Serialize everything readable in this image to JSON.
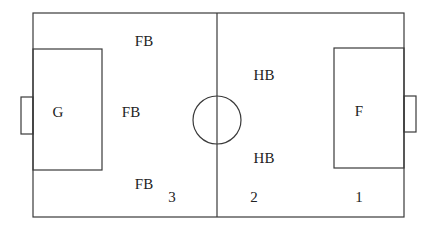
{
  "diagram": {
    "colors": {
      "line": "#3a3a3a",
      "text": "#222222",
      "background": "#ffffff"
    },
    "field": {
      "x1": 33,
      "y1": 13,
      "x2": 404,
      "y2": 217
    },
    "center_line_x": 217,
    "center_circle": {
      "cx": 217,
      "cy": 120,
      "r": 24
    },
    "left_penalty_box": {
      "x1": 33,
      "y1": 49,
      "x2": 102,
      "y2": 170
    },
    "right_penalty_box": {
      "x1": 334,
      "y1": 48,
      "x2": 404,
      "y2": 168
    },
    "left_goal": {
      "x1": 21,
      "y1": 97,
      "x2": 33,
      "y2": 134
    },
    "right_goal": {
      "x1": 404,
      "y1": 96,
      "x2": 416,
      "y2": 132
    },
    "positions": [
      {
        "label": "FB",
        "x": 144,
        "y": 41
      },
      {
        "label": "G",
        "x": 58,
        "y": 112
      },
      {
        "label": "FB",
        "x": 131,
        "y": 112
      },
      {
        "label": "FB",
        "x": 144,
        "y": 184
      },
      {
        "label": "HB",
        "x": 264,
        "y": 75
      },
      {
        "label": "HB",
        "x": 264,
        "y": 158
      },
      {
        "label": "F",
        "x": 359,
        "y": 111
      }
    ],
    "zone_numbers": [
      {
        "label": "3",
        "x": 172,
        "y": 197
      },
      {
        "label": "2",
        "x": 254,
        "y": 197
      },
      {
        "label": "1",
        "x": 359,
        "y": 197
      }
    ]
  }
}
